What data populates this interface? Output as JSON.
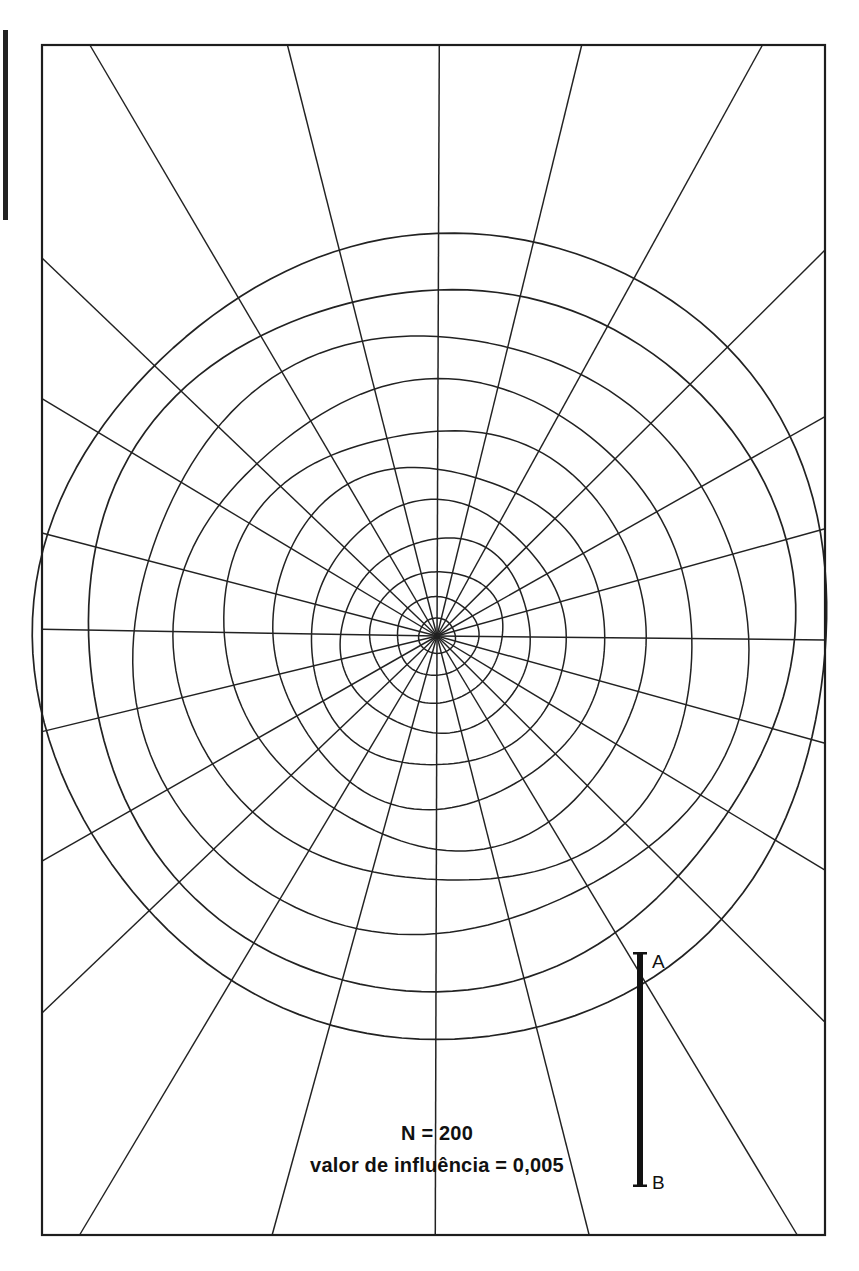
{
  "figure": {
    "kind": "polar-radial-grid-diagram",
    "background_color": "#ffffff",
    "line_color": "#222222",
    "frame": {
      "name": "plot-border",
      "x": 42,
      "y": 45,
      "width": 783,
      "height": 1190,
      "stroke_width": 2.2
    },
    "edge_artifact": {
      "name": "page-edge-mark",
      "x": 3,
      "y": 30,
      "width": 5,
      "height": 190,
      "color": "#222222"
    }
  },
  "chart_data": {
    "type": "polar-grid",
    "title": "",
    "subtitle": "",
    "xlabel": "",
    "ylabel": "",
    "grid": true,
    "legend_position": "none",
    "center": {
      "x": 437,
      "y": 636
    },
    "spoke_count": 24,
    "spoke_angles_deg": [
      0,
      15,
      30,
      45,
      60,
      75,
      90,
      105,
      120,
      135,
      150,
      165,
      180,
      195,
      210,
      225,
      240,
      255,
      270,
      285,
      300,
      315,
      330,
      345
    ],
    "ring_count": 11,
    "ring_radii_px": [
      18,
      40,
      66,
      96,
      130,
      168,
      210,
      255,
      303,
      352,
      400
    ],
    "ring_radii_note": "concentric contour rings, spacing grows outward",
    "radial_extent_px": 400,
    "annotations": [
      {
        "name": "sample-size",
        "text": "N = 200",
        "x": 437,
        "y": 1140
      },
      {
        "name": "influence-value",
        "text": "valor de influência = 0,005",
        "x": 437,
        "y": 1172
      }
    ]
  },
  "scale_bar": {
    "name": "vertical-scale-bar",
    "x": 640,
    "y_top": 952,
    "y_bottom": 1187,
    "thickness": 6,
    "color": "#111111",
    "cap_width": 14,
    "labels": {
      "top": "A",
      "bottom": "B"
    },
    "label_offset_x": 12
  },
  "caption": {
    "line1": "N = 200",
    "line2": "valor de influência = 0,005"
  },
  "colors": {
    "line": "#222222",
    "frame": "#1d1d1d",
    "text": "#111111",
    "background": "#ffffff"
  }
}
